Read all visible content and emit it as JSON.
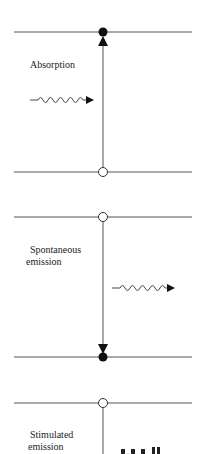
{
  "diagram": {
    "title": "",
    "colors": {
      "line": "#555555",
      "ink": "#111111",
      "background": "#ffffff"
    },
    "panels": [
      {
        "name": "absorption",
        "label_lines": [
          "Absorption"
        ],
        "upper_level": "filled",
        "lower_level": "hollow",
        "transition": "upward",
        "photon": "incoming"
      },
      {
        "name": "spontaneous-emission",
        "label_lines": [
          "Spontaneous",
          "emission"
        ],
        "upper_level": "hollow",
        "lower_level": "filled",
        "transition": "downward",
        "photon": "outgoing"
      },
      {
        "name": "stimulated-emission",
        "label_lines": [
          "Stimulated",
          "emission"
        ],
        "upper_level": "hollow",
        "transition": "downward",
        "photon": "partially visible"
      }
    ]
  }
}
